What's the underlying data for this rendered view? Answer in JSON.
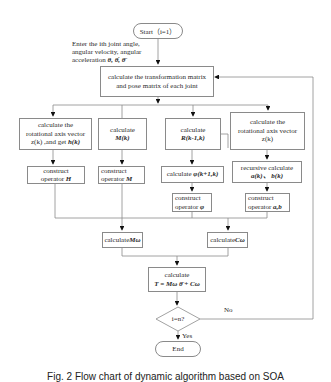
{
  "figure": {
    "start": "Start（i=1）",
    "input_note": {
      "line1": "Enter the ith joint angle,",
      "line2": "angular velocity, angular",
      "line3": "acceleration",
      "symbols": "θ,  θ̇,  θ̈"
    },
    "main_box": {
      "line1": "calculate the transformation matrix",
      "line2": "and pose matrix of each joint"
    },
    "branch1": {
      "calc_line1": "calculate the",
      "calc_line2": "rotational axis vector",
      "calc_line3": "z(k) ,and get ",
      "calc_sym": "h(k)",
      "construct_line1": "construct",
      "construct_line2": "operator ",
      "construct_sym": "H"
    },
    "branch2": {
      "calc_line1": "calculate",
      "calc_sym": "M(k)",
      "construct_line1": "construct",
      "construct_line2": "operator ",
      "construct_sym": "M"
    },
    "branch3": {
      "calc_line1": "calculate",
      "calc_sym": "R(k-1,k)",
      "phi_text": "calculate ",
      "phi_sym": "φ(k+1,k)",
      "construct_line1": "construct",
      "construct_line2": "operator ",
      "construct_sym": "φ"
    },
    "branch4": {
      "calc_line1": "calculate the",
      "calc_line2": "rotational axis vector",
      "calc_line3": "z(k)",
      "recursive_line1": "recursive calculate",
      "recursive_sym": "a(k)、 b(k)",
      "construct_line1": "construct",
      "construct_line2": "operator ",
      "construct_sym": "a,b"
    },
    "calc_m": {
      "text": "calculate",
      "sym": "Mω"
    },
    "calc_c": {
      "text": "calculate",
      "sym": "Cω"
    },
    "torque": {
      "line1": "calculate",
      "formula": "T = Mω θ̈ + Cω"
    },
    "decision": "i=n?",
    "no_label": "No",
    "yes_label": "Yes",
    "end": "End",
    "caption": "Fig. 2   Flow chart of dynamic algorithm based on SOA"
  }
}
